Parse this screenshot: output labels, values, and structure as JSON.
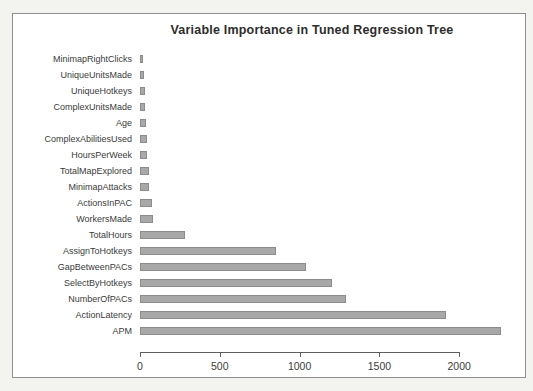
{
  "chart_data": {
    "type": "bar",
    "orientation": "horizontal",
    "title": "Variable Importance in Tuned Regression Tree",
    "categories": [
      "MinimapRightClicks",
      "UniqueUnitsMade",
      "UniqueHotkeys",
      "ComplexUnitsMade",
      "Age",
      "ComplexAbilitiesUsed",
      "HoursPerWeek",
      "TotalMapExplored",
      "MinimapAttacks",
      "ActionsInPAC",
      "WorkersMade",
      "TotalHours",
      "AssignToHotkeys",
      "GapBetweenPACs",
      "SelectByHotkeys",
      "NumberOfPACs",
      "ActionLatency",
      "APM"
    ],
    "values": [
      20,
      27,
      29,
      33,
      37,
      41,
      46,
      55,
      58,
      76,
      83,
      285,
      855,
      1040,
      1205,
      1290,
      1915,
      2265
    ],
    "xlabel": "",
    "ylabel": "",
    "xlim": [
      0,
      2250
    ],
    "x_ticks": [
      0,
      500,
      1000,
      1500,
      2000
    ],
    "grid": false,
    "legend": "none"
  },
  "colors": {
    "bar_fill": "#a8a8a8",
    "bar_border": "#8c8c8c",
    "axis": "#5f5f5f",
    "text": "#3b3b3b",
    "frame_border": "#8f8f8f",
    "frame_background": "#ffffff",
    "page_background": "#f3f3f0"
  }
}
